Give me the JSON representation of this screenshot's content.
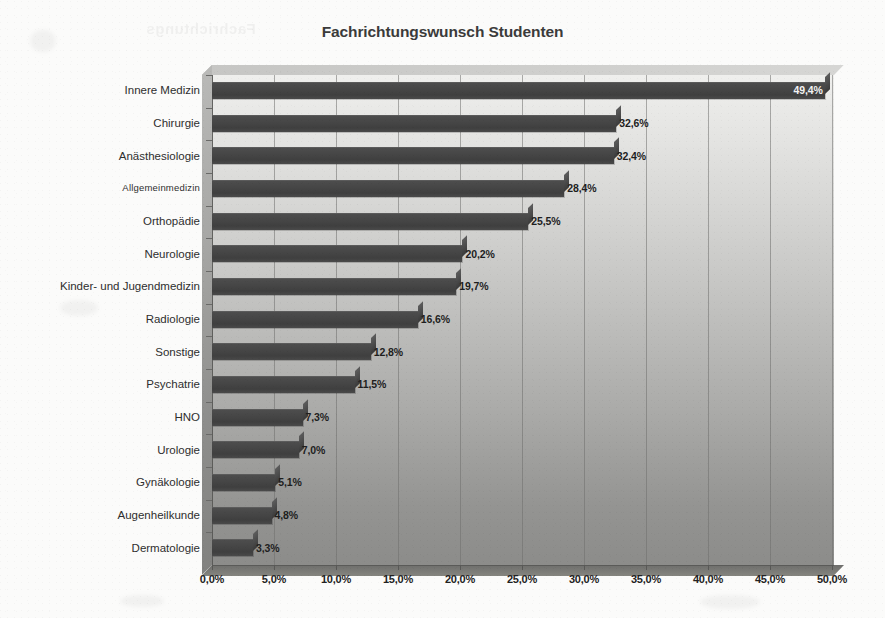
{
  "chart_data": {
    "type": "bar",
    "orientation": "horizontal",
    "title": "Fachrichtungswunsch Studenten",
    "xlabel": "",
    "ylabel": "",
    "xlim": [
      0,
      50
    ],
    "xtick_labels": [
      "0,0%",
      "5,0%",
      "10,0%",
      "15,0%",
      "20,0%",
      "25,0%",
      "30,0%",
      "35,0%",
      "40,0%",
      "45,0%",
      "50,0%"
    ],
    "xtick_values": [
      0,
      5,
      10,
      15,
      20,
      25,
      30,
      35,
      40,
      45,
      50
    ],
    "grid": "vertical",
    "legend": "none",
    "style_3d": true,
    "bar_color": "#454545",
    "plot_bg_top": "#efefed",
    "plot_bg_bottom": "#8c8c8a",
    "categories": [
      "Innere Medizin",
      "Chirurgie",
      "Anästhesiologie",
      "Allgemeinmedizin",
      "Orthopädie",
      "Neurologie",
      "Kinder- und Jugendmedizin",
      "Radiologie",
      "Sonstige",
      "Psychatrie",
      "HNO",
      "Urologie",
      "Gynäkologie",
      "Augenheilkunde",
      "Dermatologie"
    ],
    "values": [
      49.4,
      32.6,
      32.4,
      28.4,
      25.5,
      20.2,
      19.7,
      16.6,
      12.8,
      11.5,
      7.3,
      7.0,
      5.1,
      4.8,
      3.3
    ],
    "value_labels": [
      "49,4%",
      "32,6%",
      "32,4%",
      "28,4%",
      "25,5%",
      "20,2%",
      "19,7%",
      "16,6%",
      "12,8%",
      "11,5%",
      "7,3%",
      "7,0%",
      "5,1%",
      "4,8%",
      "3,3%"
    ]
  },
  "artifacts": {
    "bleed_through_text": "Fachrichtungs"
  }
}
